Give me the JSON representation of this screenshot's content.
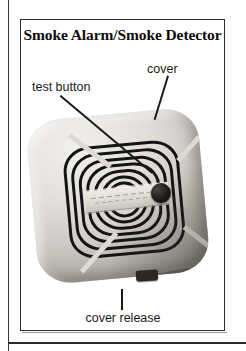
{
  "figure": {
    "title": "Smoke Alarm/Smoke Detector",
    "labels": {
      "test_button": "test button",
      "cover": "cover",
      "cover_release": "cover release"
    },
    "parts": {
      "test_button_icon": "test-button",
      "cover_icon": "cover-shell",
      "cover_release_icon": "cover-release-tab",
      "grille_icon": "vent-grille",
      "plate_icon": "label-plate"
    },
    "colors": {
      "frame": "#2c2c2c",
      "title_text": "#0b0b0b",
      "label_text": "#1a1a1a",
      "leader_line": "#1a1a1a",
      "device_light": "#f2f0ee",
      "device_mid": "#cfcbc6",
      "device_shadow": "#97918a",
      "grille_slot": "#141414",
      "test_button": "#1d1b1a",
      "page_background": "#fdfdfd"
    }
  }
}
